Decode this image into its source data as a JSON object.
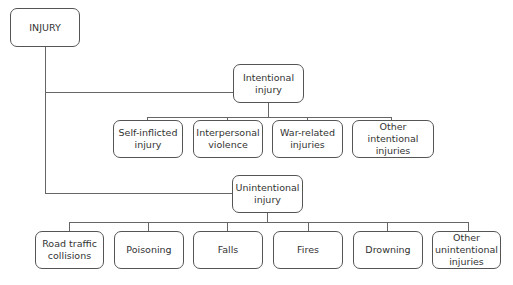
{
  "root": {
    "label": "INJURY"
  },
  "intentional": {
    "label": "Intentional\ninjury",
    "children": [
      {
        "label": "Self-inflicted\ninjury"
      },
      {
        "label": "Interpersonal\nviolence"
      },
      {
        "label": "War-related\ninjuries"
      },
      {
        "label": "Other intentional\ninjuries"
      }
    ]
  },
  "unintentional": {
    "label": "Unintentional\ninjury",
    "children": [
      {
        "label": "Road traffic\ncollisions"
      },
      {
        "label": "Poisoning"
      },
      {
        "label": "Falls"
      },
      {
        "label": "Fires"
      },
      {
        "label": "Drowning"
      },
      {
        "label": "Other\nunintentional\ninjuries"
      }
    ]
  }
}
